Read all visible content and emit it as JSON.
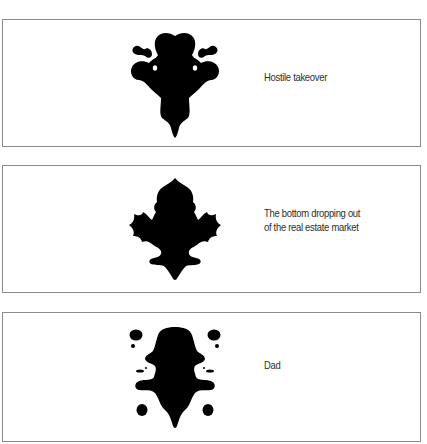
{
  "panels": [
    {
      "image": "inkblot-1",
      "caption_lines": [
        "Hostile takeover"
      ]
    },
    {
      "image": "inkblot-2",
      "caption_lines": [
        "The bottom dropping out",
        "of the real estate market"
      ]
    },
    {
      "image": "inkblot-3",
      "caption_lines": [
        "Dad"
      ]
    }
  ],
  "colors": {
    "ink": "#000000",
    "border": "#8a8a8a",
    "text": "#2e2e2e"
  }
}
